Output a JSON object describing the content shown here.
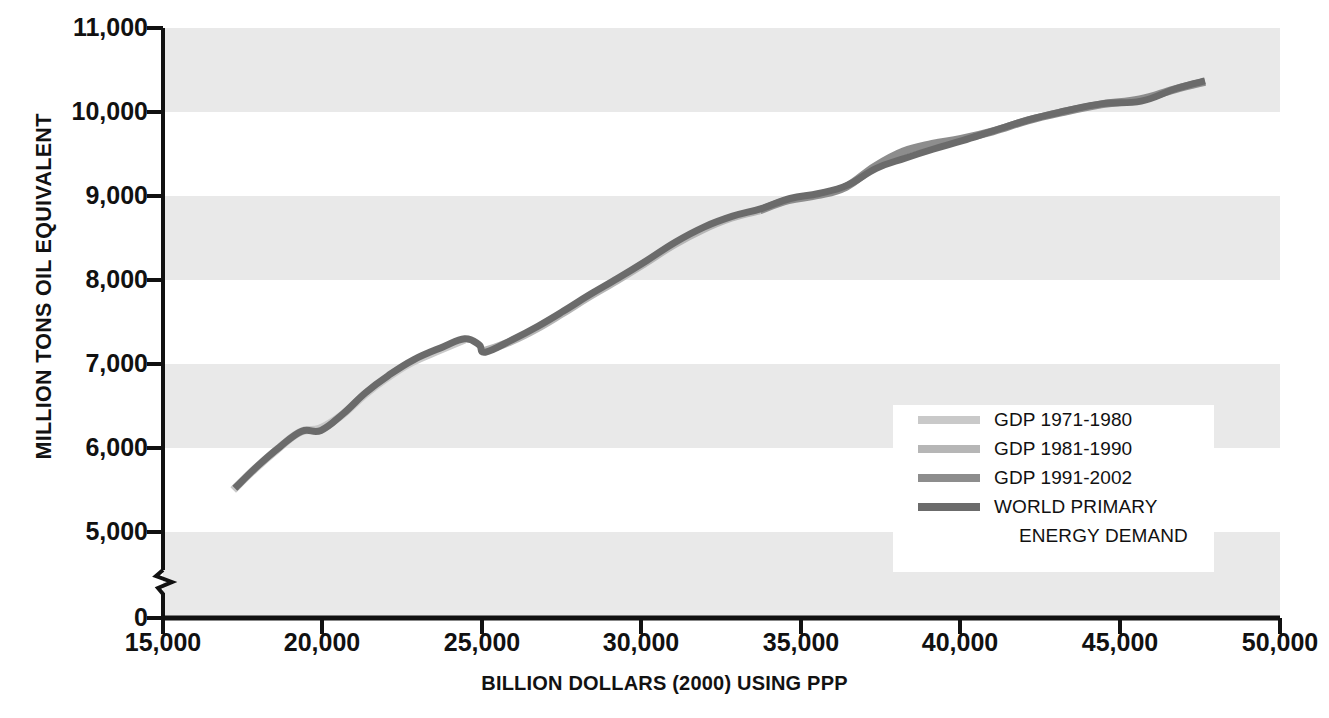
{
  "chart_data": {
    "type": "line",
    "title": "",
    "xlabel": "BILLION DOLLARS (2000) USING PPP",
    "ylabel": "MILLION TONS OIL EQUIVALENT",
    "xlim": [
      15000,
      50000
    ],
    "ylim": [
      0,
      11000
    ],
    "y_axis_break": true,
    "y_break_between": [
      600,
      4600
    ],
    "grid": "horizontal-alternating-bands",
    "legend_position": "inside-lower-right",
    "x_ticks": [
      "15,000",
      "20,000",
      "25,000",
      "30,000",
      "35,000",
      "40,000",
      "45,000",
      "50,000"
    ],
    "x_tick_values": [
      15000,
      20000,
      25000,
      30000,
      35000,
      40000,
      45000,
      50000
    ],
    "y_ticks": [
      "0",
      "5,000",
      "6,000",
      "7,000",
      "8,000",
      "9,000",
      "10,000",
      "11,000"
    ],
    "y_tick_values": [
      0,
      5000,
      6000,
      7000,
      8000,
      9000,
      10000,
      11000
    ],
    "band_ranges": [
      [
        10000,
        11000
      ],
      [
        8000,
        9000
      ],
      [
        6000,
        7000
      ],
      [
        0,
        5000
      ]
    ],
    "series": [
      {
        "name": "GDP 1971-1980",
        "color": "#c9c9c9",
        "points": [
          [
            17200,
            5500
          ],
          [
            17900,
            5760
          ],
          [
            18600,
            5990
          ],
          [
            19300,
            6190
          ],
          [
            19900,
            6230
          ],
          [
            20600,
            6390
          ],
          [
            21300,
            6630
          ],
          [
            22000,
            6830
          ],
          [
            22800,
            7020
          ],
          [
            23700,
            7170
          ],
          [
            24450,
            7290
          ]
        ]
      },
      {
        "name": "GDP 1981-1990",
        "color": "#b6b6b6",
        "points": [
          [
            25050,
            7150
          ],
          [
            25900,
            7270
          ],
          [
            26700,
            7420
          ],
          [
            27500,
            7600
          ],
          [
            28300,
            7790
          ],
          [
            29200,
            7990
          ],
          [
            30100,
            8200
          ],
          [
            31000,
            8420
          ],
          [
            31900,
            8600
          ],
          [
            32800,
            8740
          ],
          [
            33700,
            8830
          ]
        ]
      },
      {
        "name": "GDP 1991-2002",
        "color": "#8d8d8d",
        "points": [
          [
            33700,
            8830
          ],
          [
            34600,
            8950
          ],
          [
            35500,
            9010
          ],
          [
            36400,
            9110
          ],
          [
            37300,
            9350
          ],
          [
            38200,
            9530
          ],
          [
            39100,
            9620
          ],
          [
            40000,
            9680
          ],
          [
            41000,
            9770
          ],
          [
            42100,
            9900
          ],
          [
            43200,
            10000
          ],
          [
            44400,
            10090
          ],
          [
            45600,
            10150
          ],
          [
            46700,
            10270
          ],
          [
            47650,
            10360
          ]
        ]
      },
      {
        "name": "WORLD PRIMARY ENERGY DEMAND",
        "color": "#6b6b6b",
        "points": [
          [
            17250,
            5520
          ],
          [
            17950,
            5780
          ],
          [
            18650,
            6010
          ],
          [
            19350,
            6200
          ],
          [
            19950,
            6210
          ],
          [
            20650,
            6410
          ],
          [
            21350,
            6660
          ],
          [
            22050,
            6860
          ],
          [
            22850,
            7050
          ],
          [
            23750,
            7200
          ],
          [
            24450,
            7300
          ],
          [
            24900,
            7230
          ],
          [
            25100,
            7140
          ],
          [
            25950,
            7290
          ],
          [
            26750,
            7450
          ],
          [
            27550,
            7630
          ],
          [
            28350,
            7820
          ],
          [
            29250,
            8020
          ],
          [
            30150,
            8230
          ],
          [
            31050,
            8450
          ],
          [
            31950,
            8630
          ],
          [
            32850,
            8760
          ],
          [
            33750,
            8850
          ],
          [
            34650,
            8970
          ],
          [
            35550,
            9030
          ],
          [
            36450,
            9130
          ],
          [
            37350,
            9330
          ],
          [
            38250,
            9450
          ],
          [
            39150,
            9560
          ],
          [
            40050,
            9660
          ],
          [
            41050,
            9780
          ],
          [
            42150,
            9910
          ],
          [
            43250,
            10010
          ],
          [
            44450,
            10100
          ],
          [
            45650,
            10130
          ],
          [
            46750,
            10280
          ],
          [
            47650,
            10370
          ]
        ]
      }
    ]
  },
  "axis": {
    "y_label": "MILLION TONS OIL EQUIVALENT",
    "x_label": "BILLION DOLLARS (2000) USING PPP",
    "y_ticks": [
      "11,000",
      "10,000",
      "9,000",
      "8,000",
      "7,000",
      "6,000",
      "5,000",
      "0"
    ],
    "x_ticks": [
      "15,000",
      "20,000",
      "25,000",
      "30,000",
      "35,000",
      "40,000",
      "45,000",
      "50,000"
    ]
  },
  "legend": {
    "items": [
      {
        "label": "GDP 1971-1980",
        "color": "#c9c9c9"
      },
      {
        "label": "GDP 1981-1990",
        "color": "#b6b6b6"
      },
      {
        "label": "GDP 1991-2002",
        "color": "#8d8d8d"
      },
      {
        "label": "WORLD PRIMARY",
        "color": "#6b6b6b"
      }
    ],
    "continuation": "ENERGY DEMAND"
  },
  "colors": {
    "band": "#e9e9e9",
    "axis": "#111111",
    "text": "#111111",
    "legend_bg": "#ffffff"
  }
}
